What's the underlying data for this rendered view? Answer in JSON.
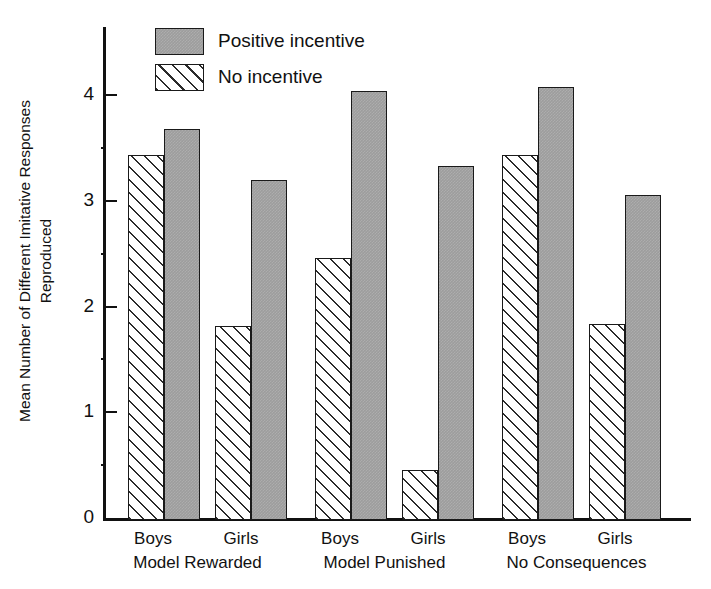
{
  "chart_data": {
    "type": "bar",
    "title": "",
    "xlabel": "",
    "ylabel": "Mean Number of Different Imitative Responses Reproduced",
    "ylabel_line1": "Mean Number of Different Imitative Responses",
    "ylabel_line2": "Reproduced",
    "ylim": [
      0,
      4.4
    ],
    "yticks": [
      0,
      1,
      2,
      3,
      4
    ],
    "ytick_labels": [
      "0",
      "1",
      "2",
      "3",
      "4"
    ],
    "grid": false,
    "legend_position": "top-left-inside",
    "categories": [
      "Boys",
      "Girls",
      "Boys",
      "Girls",
      "Boys",
      "Girls"
    ],
    "groups": [
      {
        "name": "Model Rewarded",
        "subgroups": [
          "Boys",
          "Girls"
        ]
      },
      {
        "name": "Model Punished",
        "subgroups": [
          "Boys",
          "Girls"
        ]
      },
      {
        "name": "No Consequences",
        "subgroups": [
          "Boys",
          "Girls"
        ]
      }
    ],
    "series": [
      {
        "name": "No incentive",
        "fill": "hatched",
        "values": [
          3.45,
          1.83,
          2.48,
          0.47,
          3.45,
          1.85
        ]
      },
      {
        "name": "Positive incentive",
        "fill": "gray",
        "color": "#9d9d9d",
        "values": [
          3.7,
          3.22,
          4.06,
          3.35,
          4.09,
          3.07
        ]
      }
    ],
    "bars": [
      {
        "group": "Model Rewarded",
        "sex": "Boys",
        "series": "No incentive",
        "value": 3.45
      },
      {
        "group": "Model Rewarded",
        "sex": "Boys",
        "series": "Positive incentive",
        "value": 3.7
      },
      {
        "group": "Model Rewarded",
        "sex": "Girls",
        "series": "No incentive",
        "value": 1.83
      },
      {
        "group": "Model Rewarded",
        "sex": "Girls",
        "series": "Positive incentive",
        "value": 3.22
      },
      {
        "group": "Model Punished",
        "sex": "Boys",
        "series": "No incentive",
        "value": 2.48
      },
      {
        "group": "Model Punished",
        "sex": "Boys",
        "series": "Positive incentive",
        "value": 4.06
      },
      {
        "group": "Model Punished",
        "sex": "Girls",
        "series": "No incentive",
        "value": 0.47
      },
      {
        "group": "Model Punished",
        "sex": "Girls",
        "series": "Positive incentive",
        "value": 3.35
      },
      {
        "group": "No Consequences",
        "sex": "Boys",
        "series": "No incentive",
        "value": 3.45
      },
      {
        "group": "No Consequences",
        "sex": "Boys",
        "series": "Positive incentive",
        "value": 4.09
      },
      {
        "group": "No Consequences",
        "sex": "Girls",
        "series": "No incentive",
        "value": 1.85
      },
      {
        "group": "No Consequences",
        "sex": "Girls",
        "series": "Positive incentive",
        "value": 3.07
      }
    ]
  },
  "legend": {
    "items": [
      {
        "label": "Positive incentive",
        "fill": "gray"
      },
      {
        "label": "No incentive",
        "fill": "hatched"
      }
    ]
  },
  "axis": {
    "y_labels": [
      "4",
      "3",
      "2",
      "1",
      "0"
    ]
  },
  "xaxis": {
    "sex_labels": [
      "Boys",
      "Girls",
      "Boys",
      "Girls",
      "Boys",
      "Girls"
    ],
    "group_labels": [
      "Model Rewarded",
      "Model Punished",
      "No Consequences"
    ]
  }
}
